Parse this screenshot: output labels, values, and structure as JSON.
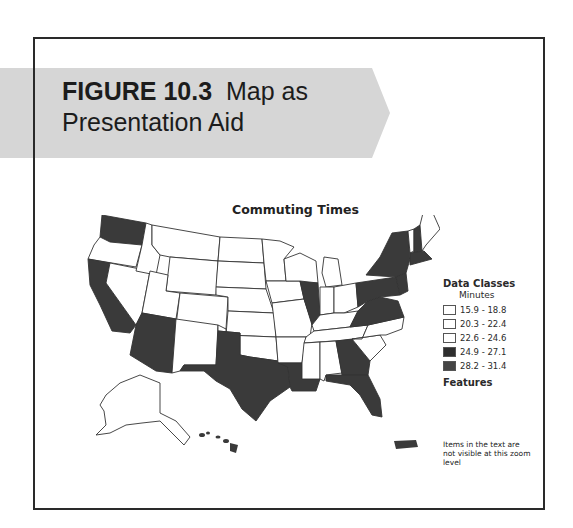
{
  "figure": {
    "label": "FIGURE 10.3",
    "title_line1": "Map as",
    "title_line2": "Presentation Aid"
  },
  "map": {
    "title": "Commuting Times",
    "dark_states": [
      "Washington",
      "California",
      "Arizona",
      "Texas",
      "Louisiana",
      "Illinois",
      "Georgia",
      "Florida",
      "New York",
      "Pennsylvania",
      "New Jersey",
      "Maryland",
      "Virginia",
      "West Virginia",
      "New Hampshire",
      "Massachusetts",
      "Connecticut",
      "Delaware",
      "Puerto Rico"
    ],
    "colors": {
      "light": "#ffffff",
      "dark": "#3a3a3a",
      "outline": "#333333"
    }
  },
  "legend": {
    "title": "Data Classes",
    "subtitle": "Minutes",
    "classes": [
      {
        "range": "15.9 - 18.8",
        "color": "#ffffff"
      },
      {
        "range": "20.3 - 22.4",
        "color": "#ffffff"
      },
      {
        "range": "22.6 - 24.6",
        "color": "#ffffff"
      },
      {
        "range": "24.9 - 27.1",
        "color": "#2e2e2e"
      },
      {
        "range": "28.2 - 31.4",
        "color": "#444444"
      }
    ],
    "features_label": "Features",
    "note": "Items in the text are not visible at this zoom level"
  }
}
